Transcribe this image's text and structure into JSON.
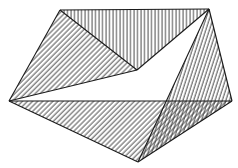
{
  "diagram": {
    "type": "hatched-polyhedron",
    "width": 238,
    "height": 168,
    "background": "#ffffff",
    "stroke_color": "#1a1a1a",
    "hatch_color": "#3a3a3a",
    "vertices": {
      "top_left": [
        60,
        10
      ],
      "top_right": [
        209,
        9
      ],
      "left": [
        9,
        101
      ],
      "right": [
        232,
        101
      ],
      "inner": [
        137,
        70
      ],
      "bottom": [
        138,
        162
      ],
      "crossing": [
        165,
        101
      ]
    },
    "faces": [
      {
        "name": "top-face",
        "vertices": [
          "top_left",
          "top_right",
          "inner"
        ],
        "hatch": "vertical"
      },
      {
        "name": "upper-left-face",
        "vertices": [
          "top_left",
          "left",
          "inner"
        ],
        "hatch": "diagonal-45"
      },
      {
        "name": "right-face",
        "vertices": [
          "top_right",
          "right",
          "bottom"
        ],
        "hatch": "steep-diagonal"
      },
      {
        "name": "bottom-left-face",
        "vertices": [
          "left",
          "right",
          "bottom"
        ],
        "hatch": "diagonal-45"
      },
      {
        "name": "open-face",
        "vertices": [
          "left",
          "inner",
          "top_right",
          "crossing"
        ],
        "hatch": "none"
      }
    ]
  }
}
